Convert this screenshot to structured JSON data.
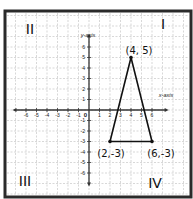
{
  "figure": {
    "corner_label": "a.",
    "axes": {
      "x_label": "x-axis",
      "y_label": "y-axis",
      "x_ticks": [
        "-6",
        "-5",
        "-4",
        "-3",
        "-2",
        "-1",
        "1",
        "2",
        "3",
        "4",
        "5",
        "6"
      ],
      "y_ticks": [
        "6",
        "5",
        "4",
        "3",
        "2",
        "1",
        "-1",
        "-2",
        "-3",
        "-4",
        "-5",
        "-6"
      ],
      "origin_label": "0"
    },
    "quadrants": {
      "q1": "I",
      "q2": "II",
      "q3": "III",
      "q4": "IV"
    },
    "points": [
      {
        "label": "(4, 5)",
        "x": 4,
        "y": 5
      },
      {
        "label": "(2,-3)",
        "x": 2,
        "y": -3
      },
      {
        "label": "(6,-3)",
        "x": 6,
        "y": -3
      }
    ],
    "colors": {
      "border": "#2a2a2a",
      "grid": "#bdbdbd",
      "axis": "#333333",
      "ink": "#111111"
    }
  }
}
